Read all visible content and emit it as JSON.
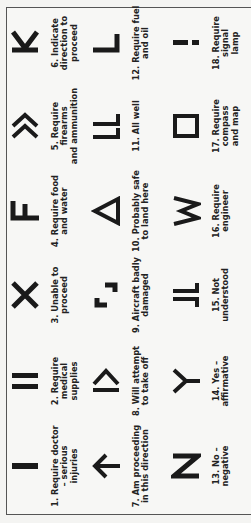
{
  "chart": {
    "title": "",
    "orientation": "rotated-90-ccw",
    "signals": [
      {
        "num": "1.",
        "label": "Require doctor\n– serious\ninjuries",
        "symbol": "I",
        "icon": "single-bar-icon"
      },
      {
        "num": "2.",
        "label": "Require medical\nsupplies",
        "symbol": "II",
        "icon": "double-bar-icon"
      },
      {
        "num": "3.",
        "label": "Unable to\nproceed",
        "symbol": "X",
        "icon": "x-icon"
      },
      {
        "num": "4.",
        "label": "Require food\nand water",
        "symbol": "F",
        "icon": "f-icon"
      },
      {
        "num": "5.",
        "label": "Require firearms\nand ammunition",
        "symbol": "»",
        "icon": "double-chevron-icon"
      },
      {
        "num": "6.",
        "label": "Indicate\ndirection to\nproceed",
        "symbol": "K",
        "icon": "k-icon"
      },
      {
        "num": "7.",
        "label": "Am proceeding\nin this direction",
        "symbol": "↑",
        "icon": "arrow-icon"
      },
      {
        "num": "8.",
        "label": "Will attempt\nto take off",
        "symbol": "|>",
        "icon": "bar-chevron-icon"
      },
      {
        "num": "9.",
        "label": "Aircraft badly\ndamaged",
        "symbol": "┘┌",
        "icon": "broken-square-icon"
      },
      {
        "num": "10.",
        "label": "Probably safe\nto land here",
        "symbol": "Δ",
        "icon": "triangle-icon"
      },
      {
        "num": "11.",
        "label": "All well",
        "symbol": "LL",
        "icon": "double-l-icon"
      },
      {
        "num": "12.",
        "label": "Require fuel\nand oil",
        "symbol": "L",
        "icon": "l-icon"
      },
      {
        "num": "13.",
        "label": "No –\nnegative",
        "symbol": "N",
        "icon": "n-icon"
      },
      {
        "num": "14.",
        "label": "Yes –\naffirmative",
        "symbol": "Y",
        "icon": "y-icon"
      },
      {
        "num": "15.",
        "label": "Not\nunderstood",
        "symbol": "JL",
        "icon": "jl-icon"
      },
      {
        "num": "16.",
        "label": "Require\nengineer",
        "symbol": "W",
        "icon": "w-icon"
      },
      {
        "num": "17.",
        "label": "Require\ncompass\nand map",
        "symbol": "□",
        "icon": "square-icon"
      },
      {
        "num": "18.",
        "label": "Require\nsignal\nlamp",
        "symbol": "¡",
        "icon": "dashes-icon"
      }
    ]
  },
  "labels": {
    "s1": "1. Require doctor\n– serious\ninjuries",
    "s2": "2. Require medical\nsupplies",
    "s3": "3. Unable to\nproceed",
    "s4": "4. Require food\nand water",
    "s5": "5. Require firearms\nand ammunition",
    "s6": "6. Indicate\ndirection to\nproceed",
    "s7": "7. Am proceeding\nin this direction",
    "s8": "8. Will attempt\nto take off",
    "s9": "9. Aircraft badly\ndamaged",
    "s10": "10. Probably safe\nto land here",
    "s11": "11. All well",
    "s12": "12. Require fuel\nand oil",
    "s13": "13. No –\nnegative",
    "s14": "14. Yes –\naffirmative",
    "s15": "15. Not\nunderstood",
    "s16": "16. Require\nengineer",
    "s17": "17. Require\ncompass\nand map",
    "s18": "18. Require\nsignal\nlamp"
  },
  "colors": {
    "ink": "#1a1a1a",
    "paper": "#f7f7f5",
    "border": "#555555"
  }
}
